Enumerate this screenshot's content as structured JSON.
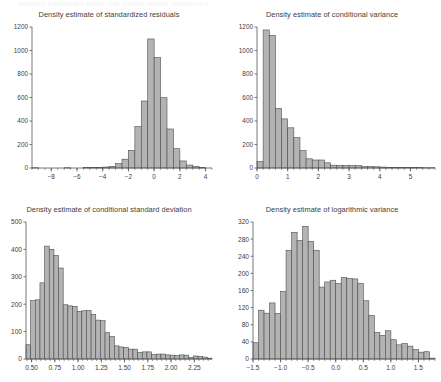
{
  "page": {
    "faint_header": "DENSITY ESTIMATES FROM THE GARCH MODEL RESIDUALS",
    "background_color": "#ffffff",
    "bar_fill_color": "#b3b3b3",
    "bar_stroke_color": "#4d4d4d",
    "axis_color": "#555555",
    "text_color": "#3d3d3d"
  },
  "chart_data": [
    {
      "id": "standardized-residuals",
      "type": "bar",
      "title": "Density estimate of standardized residuals",
      "xlabel": "",
      "ylabel": "",
      "grid": false,
      "legend": null,
      "xlim": [
        -9.5,
        4.5
      ],
      "ylim": [
        0,
        1200
      ],
      "xticks": [
        -8,
        -6,
        -4,
        -2,
        0,
        2,
        4
      ],
      "xticklabels": [
        "-8",
        "-6",
        "-4",
        "-2",
        "0",
        "2",
        "4"
      ],
      "minor_xtick_step": 0.5,
      "yticks": [
        0,
        200,
        400,
        600,
        800,
        1000,
        1200
      ],
      "yticklabels": [
        "0",
        "200",
        "400",
        "600",
        "800",
        "1000",
        "1200"
      ],
      "bin_width": 0.5,
      "bins": [
        {
          "x0": -9.5,
          "x1": -9.0,
          "value": 2
        },
        {
          "x0": -9.0,
          "x1": -8.5,
          "value": 0
        },
        {
          "x0": -8.5,
          "x1": -8.0,
          "value": 0
        },
        {
          "x0": -8.0,
          "x1": -7.5,
          "value": 0
        },
        {
          "x0": -7.5,
          "x1": -7.0,
          "value": 0
        },
        {
          "x0": -7.0,
          "x1": -6.5,
          "value": 2
        },
        {
          "x0": -6.5,
          "x1": -6.0,
          "value": 0
        },
        {
          "x0": -6.0,
          "x1": -5.5,
          "value": 0
        },
        {
          "x0": -5.5,
          "x1": -5.0,
          "value": 3
        },
        {
          "x0": -5.0,
          "x1": -4.5,
          "value": 4
        },
        {
          "x0": -4.5,
          "x1": -4.0,
          "value": 4
        },
        {
          "x0": -4.0,
          "x1": -3.5,
          "value": 8
        },
        {
          "x0": -3.5,
          "x1": -3.0,
          "value": 14
        },
        {
          "x0": -3.0,
          "x1": -2.5,
          "value": 38
        },
        {
          "x0": -2.5,
          "x1": -2.0,
          "value": 75
        },
        {
          "x0": -2.0,
          "x1": -1.5,
          "value": 150
        },
        {
          "x0": -1.5,
          "x1": -1.0,
          "value": 352
        },
        {
          "x0": -1.0,
          "x1": -0.5,
          "value": 570
        },
        {
          "x0": -0.5,
          "x1": 0.0,
          "value": 1098
        },
        {
          "x0": 0.0,
          "x1": 0.5,
          "value": 940
        },
        {
          "x0": 0.5,
          "x1": 1.0,
          "value": 598
        },
        {
          "x0": 1.0,
          "x1": 1.5,
          "value": 332
        },
        {
          "x0": 1.5,
          "x1": 2.0,
          "value": 164
        },
        {
          "x0": 2.0,
          "x1": 2.5,
          "value": 60
        },
        {
          "x0": 2.5,
          "x1": 3.0,
          "value": 25
        },
        {
          "x0": 3.0,
          "x1": 3.5,
          "value": 12
        },
        {
          "x0": 3.5,
          "x1": 4.0,
          "value": 4
        }
      ]
    },
    {
      "id": "conditional-variance",
      "type": "bar",
      "title": "Density estimate of conditional variance",
      "xlabel": "",
      "ylabel": "",
      "grid": false,
      "legend": null,
      "xlim": [
        0,
        5.8
      ],
      "ylim": [
        0,
        1200
      ],
      "xticks": [
        0,
        1,
        2,
        3,
        4,
        5
      ],
      "xticklabels": [
        "0",
        "1",
        "2",
        "3",
        "4",
        "5"
      ],
      "minor_xtick_step": 0.2,
      "yticks": [
        0,
        200,
        400,
        600,
        800,
        1000,
        1200
      ],
      "yticklabels": [
        "0",
        "200",
        "400",
        "600",
        "800",
        "1000",
        "1200"
      ],
      "bin_width": 0.2,
      "bins": [
        {
          "x0": 0.0,
          "x1": 0.2,
          "value": 55
        },
        {
          "x0": 0.2,
          "x1": 0.4,
          "value": 1175
        },
        {
          "x0": 0.4,
          "x1": 0.6,
          "value": 1128
        },
        {
          "x0": 0.6,
          "x1": 0.8,
          "value": 508
        },
        {
          "x0": 0.8,
          "x1": 1.0,
          "value": 418
        },
        {
          "x0": 1.0,
          "x1": 1.2,
          "value": 342
        },
        {
          "x0": 1.2,
          "x1": 1.4,
          "value": 258
        },
        {
          "x0": 1.4,
          "x1": 1.6,
          "value": 148
        },
        {
          "x0": 1.6,
          "x1": 1.8,
          "value": 78
        },
        {
          "x0": 1.8,
          "x1": 2.0,
          "value": 68
        },
        {
          "x0": 2.0,
          "x1": 2.2,
          "value": 68
        },
        {
          "x0": 2.2,
          "x1": 2.4,
          "value": 44
        },
        {
          "x0": 2.4,
          "x1": 2.6,
          "value": 24
        },
        {
          "x0": 2.6,
          "x1": 2.8,
          "value": 22
        },
        {
          "x0": 2.8,
          "x1": 3.0,
          "value": 22
        },
        {
          "x0": 3.0,
          "x1": 3.2,
          "value": 20
        },
        {
          "x0": 3.2,
          "x1": 3.4,
          "value": 20
        },
        {
          "x0": 3.4,
          "x1": 3.6,
          "value": 12
        },
        {
          "x0": 3.6,
          "x1": 3.8,
          "value": 12
        },
        {
          "x0": 3.8,
          "x1": 4.0,
          "value": 10
        },
        {
          "x0": 4.0,
          "x1": 4.2,
          "value": 8
        },
        {
          "x0": 4.2,
          "x1": 4.4,
          "value": 6
        },
        {
          "x0": 4.4,
          "x1": 4.6,
          "value": 6
        },
        {
          "x0": 4.6,
          "x1": 4.8,
          "value": 5
        },
        {
          "x0": 4.8,
          "x1": 5.0,
          "value": 4
        },
        {
          "x0": 5.0,
          "x1": 5.2,
          "value": 3
        },
        {
          "x0": 5.2,
          "x1": 5.4,
          "value": 3
        },
        {
          "x0": 5.4,
          "x1": 5.6,
          "value": 2
        },
        {
          "x0": 5.6,
          "x1": 5.8,
          "value": 2
        }
      ]
    },
    {
      "id": "conditional-standard-deviation",
      "type": "bar",
      "title": "Density estimate of conditional standard deviation",
      "xlabel": "",
      "ylabel": "",
      "grid": false,
      "legend": null,
      "xlim": [
        0.44,
        2.44
      ],
      "ylim": [
        0,
        500
      ],
      "xticks": [
        0.5,
        0.75,
        1.0,
        1.25,
        1.5,
        1.75,
        2.0,
        2.25
      ],
      "xticklabels": [
        "0.50",
        "0.75",
        "1.00",
        "1.25",
        "1.50",
        "1.75",
        "2.00",
        "2.25"
      ],
      "minor_xtick_step": 0.05,
      "yticks": [
        0,
        100,
        200,
        300,
        400,
        500
      ],
      "yticklabels": [
        "0",
        "100",
        "200",
        "300",
        "400",
        "500"
      ],
      "bin_width": 0.05,
      "bins": [
        {
          "x0": 0.44,
          "x1": 0.49,
          "value": 52
        },
        {
          "x0": 0.49,
          "x1": 0.54,
          "value": 213
        },
        {
          "x0": 0.54,
          "x1": 0.59,
          "value": 216
        },
        {
          "x0": 0.59,
          "x1": 0.64,
          "value": 278
        },
        {
          "x0": 0.64,
          "x1": 0.69,
          "value": 412
        },
        {
          "x0": 0.69,
          "x1": 0.74,
          "value": 400
        },
        {
          "x0": 0.74,
          "x1": 0.79,
          "value": 378
        },
        {
          "x0": 0.79,
          "x1": 0.84,
          "value": 332
        },
        {
          "x0": 0.84,
          "x1": 0.89,
          "value": 198
        },
        {
          "x0": 0.89,
          "x1": 0.94,
          "value": 194
        },
        {
          "x0": 0.94,
          "x1": 0.99,
          "value": 192
        },
        {
          "x0": 0.99,
          "x1": 1.04,
          "value": 174
        },
        {
          "x0": 1.04,
          "x1": 1.09,
          "value": 176
        },
        {
          "x0": 1.09,
          "x1": 1.14,
          "value": 177
        },
        {
          "x0": 1.14,
          "x1": 1.19,
          "value": 162
        },
        {
          "x0": 1.19,
          "x1": 1.24,
          "value": 142
        },
        {
          "x0": 1.24,
          "x1": 1.29,
          "value": 140
        },
        {
          "x0": 1.29,
          "x1": 1.34,
          "value": 96
        },
        {
          "x0": 1.34,
          "x1": 1.39,
          "value": 82
        },
        {
          "x0": 1.39,
          "x1": 1.44,
          "value": 48
        },
        {
          "x0": 1.44,
          "x1": 1.49,
          "value": 44
        },
        {
          "x0": 1.49,
          "x1": 1.54,
          "value": 42
        },
        {
          "x0": 1.54,
          "x1": 1.59,
          "value": 36
        },
        {
          "x0": 1.59,
          "x1": 1.64,
          "value": 36
        },
        {
          "x0": 1.64,
          "x1": 1.69,
          "value": 24
        },
        {
          "x0": 1.69,
          "x1": 1.74,
          "value": 26
        },
        {
          "x0": 1.74,
          "x1": 1.79,
          "value": 26
        },
        {
          "x0": 1.79,
          "x1": 1.84,
          "value": 16
        },
        {
          "x0": 1.84,
          "x1": 1.89,
          "value": 18
        },
        {
          "x0": 1.89,
          "x1": 1.94,
          "value": 18
        },
        {
          "x0": 1.94,
          "x1": 1.99,
          "value": 15
        },
        {
          "x0": 1.99,
          "x1": 2.04,
          "value": 14
        },
        {
          "x0": 2.04,
          "x1": 2.09,
          "value": 13
        },
        {
          "x0": 2.09,
          "x1": 2.14,
          "value": 15
        },
        {
          "x0": 2.14,
          "x1": 2.19,
          "value": 14
        },
        {
          "x0": 2.19,
          "x1": 2.24,
          "value": 6
        },
        {
          "x0": 2.24,
          "x1": 2.29,
          "value": 11
        },
        {
          "x0": 2.29,
          "x1": 2.34,
          "value": 9
        },
        {
          "x0": 2.34,
          "x1": 2.39,
          "value": 7
        },
        {
          "x0": 2.39,
          "x1": 2.44,
          "value": 3
        }
      ]
    },
    {
      "id": "logarithmic-variance",
      "type": "bar",
      "title": "Density estimate of logarithmic variance",
      "xlabel": "",
      "ylabel": "",
      "grid": false,
      "legend": null,
      "xlim": [
        -1.5,
        1.8
      ],
      "ylim": [
        0,
        320
      ],
      "xticks": [
        -1.5,
        -1.0,
        -0.5,
        0.0,
        0.5,
        1.0,
        1.5
      ],
      "xticklabels": [
        "-1.5",
        "-1.0",
        "-0.5",
        "0.0",
        "0.5",
        "1.0",
        "1.5"
      ],
      "minor_xtick_step": 0.1,
      "yticks": [
        0,
        40,
        80,
        120,
        160,
        200,
        240,
        280,
        320
      ],
      "yticklabels": [
        "0",
        "40",
        "80",
        "120",
        "160",
        "200",
        "240",
        "280",
        "320"
      ],
      "bin_width": 0.1,
      "bins": [
        {
          "x0": -1.5,
          "x1": -1.4,
          "value": 38
        },
        {
          "x0": -1.4,
          "x1": -1.3,
          "value": 114
        },
        {
          "x0": -1.3,
          "x1": -1.2,
          "value": 107
        },
        {
          "x0": -1.2,
          "x1": -1.1,
          "value": 131
        },
        {
          "x0": -1.1,
          "x1": -1.0,
          "value": 106
        },
        {
          "x0": -1.0,
          "x1": -0.9,
          "value": 158
        },
        {
          "x0": -0.9,
          "x1": -0.8,
          "value": 254
        },
        {
          "x0": -0.8,
          "x1": -0.7,
          "value": 296
        },
        {
          "x0": -0.7,
          "x1": -0.6,
          "value": 277
        },
        {
          "x0": -0.6,
          "x1": -0.5,
          "value": 310
        },
        {
          "x0": -0.5,
          "x1": -0.4,
          "value": 275
        },
        {
          "x0": -0.4,
          "x1": -0.3,
          "value": 254
        },
        {
          "x0": -0.3,
          "x1": -0.2,
          "value": 168
        },
        {
          "x0": -0.2,
          "x1": -0.1,
          "value": 180
        },
        {
          "x0": -0.1,
          "x1": 0.0,
          "value": 184
        },
        {
          "x0": 0.0,
          "x1": 0.1,
          "value": 176
        },
        {
          "x0": 0.1,
          "x1": 0.2,
          "value": 190
        },
        {
          "x0": 0.2,
          "x1": 0.3,
          "value": 188
        },
        {
          "x0": 0.3,
          "x1": 0.4,
          "value": 187
        },
        {
          "x0": 0.4,
          "x1": 0.5,
          "value": 176
        },
        {
          "x0": 0.5,
          "x1": 0.6,
          "value": 136
        },
        {
          "x0": 0.6,
          "x1": 0.7,
          "value": 102
        },
        {
          "x0": 0.7,
          "x1": 0.8,
          "value": 62
        },
        {
          "x0": 0.8,
          "x1": 0.9,
          "value": 55
        },
        {
          "x0": 0.9,
          "x1": 1.0,
          "value": 66
        },
        {
          "x0": 1.0,
          "x1": 1.1,
          "value": 45
        },
        {
          "x0": 1.1,
          "x1": 1.2,
          "value": 33
        },
        {
          "x0": 1.2,
          "x1": 1.3,
          "value": 36
        },
        {
          "x0": 1.3,
          "x1": 1.4,
          "value": 30
        },
        {
          "x0": 1.4,
          "x1": 1.5,
          "value": 22
        },
        {
          "x0": 1.5,
          "x1": 1.6,
          "value": 16
        },
        {
          "x0": 1.6,
          "x1": 1.7,
          "value": 17
        },
        {
          "x0": 1.7,
          "x1": 1.8,
          "value": 2
        }
      ]
    }
  ]
}
